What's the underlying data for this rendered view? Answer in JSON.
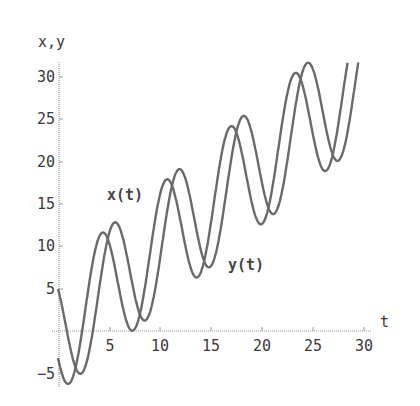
{
  "chart_data": {
    "type": "line",
    "title": "",
    "xlabel": "t",
    "ylabel": "x,y",
    "xlim": [
      0,
      31
    ],
    "ylim": [
      -6,
      32
    ],
    "grid": false,
    "legend": "none (inline curve labels)",
    "x_ticks": [
      5,
      10,
      15,
      20,
      25,
      30
    ],
    "y_ticks": [
      -5,
      5,
      10,
      15,
      20,
      25,
      30
    ],
    "annotations": [
      {
        "text": "x(t)",
        "t": 5.2,
        "value": 15.9
      },
      {
        "text": "y(t)",
        "t": 16.5,
        "value": 7.8
      }
    ],
    "series": [
      {
        "name": "x(t)",
        "formula_approx": "t + 7.3*cos(t - 4.26)",
        "points": [
          [
            0,
            -3.2
          ],
          [
            0.9,
            -5.3
          ],
          [
            2,
            -4.3
          ],
          [
            3,
            0.3
          ],
          [
            4.4,
            11.6
          ],
          [
            6,
            11.4
          ],
          [
            7.5,
            0.7
          ],
          [
            10,
            16.3
          ],
          [
            10.7,
            17.9
          ],
          [
            13.5,
            6.3
          ],
          [
            16.9,
            24.2
          ],
          [
            19.8,
            12.5
          ],
          [
            23.3,
            30.5
          ],
          [
            26.1,
            18.8
          ],
          [
            28.7,
            31.5
          ]
        ]
      },
      {
        "name": "y(t)",
        "formula_approx": "t + 7.3*cos(t - 5.46)",
        "points": [
          [
            0,
            4.9
          ],
          [
            1,
            -2.6
          ],
          [
            2.3,
            -5.7
          ],
          [
            4,
            3.5
          ],
          [
            5.6,
            12.8
          ],
          [
            8.6,
            1.4
          ],
          [
            11.9,
            19.1
          ],
          [
            14.8,
            5.8
          ],
          [
            18.2,
            25.4
          ],
          [
            21.1,
            12.3
          ],
          [
            24.5,
            31.7
          ],
          [
            27.4,
            18.6
          ],
          [
            30,
            31.4
          ]
        ]
      }
    ]
  },
  "axes": {
    "y_axis_label": "x,y",
    "x_axis_label": "t",
    "x_tick_labels": [
      "5",
      "10",
      "15",
      "20",
      "25",
      "30"
    ],
    "y_tick_labels": [
      "30",
      "25",
      "20",
      "15",
      "10",
      "5",
      "−5"
    ]
  },
  "labels": {
    "x_curve": "x(t)",
    "y_curve": "y(t)"
  },
  "colors": {
    "curve": "#6a6a6a",
    "axis": "#9a9a9a",
    "text": "#3a3a3a"
  }
}
